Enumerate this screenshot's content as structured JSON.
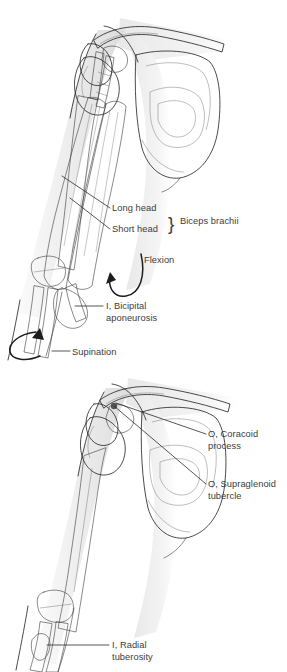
{
  "plate": {
    "title": "Biceps brachii attachments and actions",
    "background_color": "#ffffff"
  },
  "palette": {
    "skin_light": "#efefef",
    "skin_shadow": "#dcdcdc",
    "bone_light": "#dedede",
    "bone_mid": "#c6c6c6",
    "bone_shadow": "#aeaeae",
    "muscle_mid": "#9a9a9a",
    "muscle_dark": "#7c7c7c",
    "muscle_darkest": "#6a6a6a",
    "tendon": "#b9b9b9",
    "aponeurosis": "#a2a2a2",
    "highlight_white": "#fcfcfc",
    "ink": "#2a2a2a",
    "label_text": "#3c3c3c"
  },
  "upper_figure": {
    "name": "anterior-arm-with-biceps-muscle",
    "description": "Anterior right shoulder and arm showing the biceps brachii with long and short heads, bicipital aponeurosis, and action arrows",
    "labels": [
      {
        "id": "long-head",
        "text": "Long head",
        "text_x": 112,
        "text_y": 211,
        "anchor": "start",
        "leader": "M110,208 L62,176"
      },
      {
        "id": "short-head",
        "text": "Short head",
        "text_x": 112,
        "text_y": 232,
        "anchor": "start",
        "leader": "M110,229 L70,198"
      },
      {
        "id": "biceps-brachii",
        "text": "Biceps brachii",
        "text_x": 180,
        "text_y": 224,
        "anchor": "start",
        "leader": ""
      },
      {
        "id": "flexion",
        "text": "Flexion",
        "text_x": 144,
        "text_y": 263,
        "anchor": "start",
        "leader": ""
      },
      {
        "id": "bicipital-aponeurosis-line1",
        "text": "I, Bicipital",
        "text_x": 106,
        "text_y": 309,
        "anchor": "start",
        "leader": "M103,306 L75,306"
      },
      {
        "id": "bicipital-aponeurosis-line2",
        "text": "aponeurosis",
        "text_x": 106,
        "text_y": 321,
        "anchor": "start",
        "leader": ""
      },
      {
        "id": "supination",
        "text": "Supination",
        "text_x": 72,
        "text_y": 355,
        "anchor": "start",
        "leader": "M70,351 L52,351"
      }
    ],
    "brace_symbol": "}",
    "brace_x": 168,
    "brace_y": 230
  },
  "lower_figure": {
    "name": "skeletal-arm-with-attachment-sites",
    "description": "Anterior right shoulder and arm skeleton showing origin sites on the coracoid process and supraglenoid tubercle and insertion on the radial tuberosity",
    "labels": [
      {
        "id": "coracoid-process-line1",
        "text": "O, Coracoid",
        "text_x": 208,
        "text_y": 437,
        "anchor": "start",
        "leader": "M206,434 L116,403"
      },
      {
        "id": "coracoid-process-line2",
        "text": "process",
        "text_x": 208,
        "text_y": 449,
        "anchor": "start",
        "leader": ""
      },
      {
        "id": "supraglenoid-tubercle-line1",
        "text": "O, Supraglenoid",
        "text_x": 208,
        "text_y": 487,
        "anchor": "start",
        "leader": "M206,484 L114,406"
      },
      {
        "id": "supraglenoid-tubercle-line2",
        "text": "tubercle",
        "text_x": 208,
        "text_y": 499,
        "anchor": "start",
        "leader": ""
      },
      {
        "id": "radial-tuberosity-line1",
        "text": "I, Radial",
        "text_x": 112,
        "text_y": 648,
        "anchor": "start",
        "leader": "M109,645 L47,645"
      },
      {
        "id": "radial-tuberosity-line2",
        "text": "tuberosity",
        "text_x": 112,
        "text_y": 660,
        "anchor": "start",
        "leader": ""
      }
    ]
  },
  "icons": {
    "flexion_arrow": "curved-arrow-icon",
    "supination_arrow": "curved-arrow-icon"
  }
}
